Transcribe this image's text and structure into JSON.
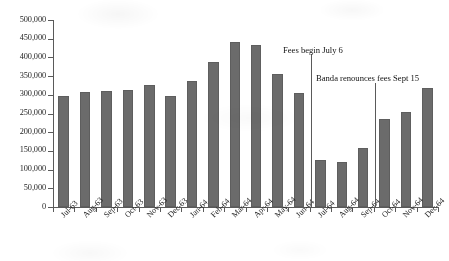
{
  "chart_data": {
    "type": "bar",
    "title": "",
    "xlabel": "",
    "ylabel": "",
    "ylim": [
      0,
      500000
    ],
    "ytick_step": 50000,
    "grid": false,
    "legend": null,
    "bar_color": "#6b6b6b",
    "axis_color": "#5a5a5a",
    "ytick_labels": [
      "500,000",
      "450,000",
      "400,000",
      "350,000",
      "300,000",
      "250,000",
      "200,000",
      "150,000",
      "100,000",
      "50,000",
      "0"
    ],
    "ytick_values": [
      500000,
      450000,
      400000,
      350000,
      300000,
      250000,
      200000,
      150000,
      100000,
      50000,
      0
    ],
    "categories": [
      "Jul-63",
      "Aug-63",
      "Sep-63",
      "Oct-63",
      "Nov-63",
      "Dec-63",
      "Jan-64",
      "Feb-64",
      "Mar-64",
      "Apr-64",
      "May-64",
      "Jun-64",
      "Jul-64",
      "Aug-64",
      "Sep-64",
      "Oct-64",
      "Nov-64",
      "Dec-64"
    ],
    "values": [
      296000,
      308000,
      309000,
      312000,
      326000,
      297000,
      337000,
      389000,
      441000,
      434000,
      356000,
      306000,
      127000,
      121000,
      158000,
      236000,
      254000,
      318000
    ],
    "annotations": [
      {
        "label": "Fees begin July 6",
        "category_boundary": "Jun-64 / Jul-64",
        "text_x": 283,
        "text_y": 45,
        "line_x": 311,
        "line_y_top": 54,
        "line_y_bottom": 207
      },
      {
        "label": "Banda renounces fees Sept 15",
        "category_boundary": "Sep-64 / Oct-64",
        "text_x": 316,
        "text_y": 73,
        "line_x": 375,
        "line_y_top": 83,
        "line_y_bottom": 207
      }
    ]
  }
}
